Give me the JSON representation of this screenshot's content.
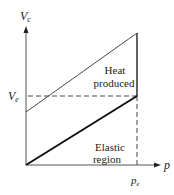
{
  "diagram": {
    "axes": {
      "y_label": "V",
      "y_label_sub": "c",
      "x_label": "p",
      "y_tick_label": "V",
      "y_tick_sub": "e",
      "x_tick_label": "p",
      "x_tick_sub": "e"
    },
    "regions": {
      "upper": {
        "line1": "Heat",
        "line2": "produced"
      },
      "lower": {
        "line1": "Elastic",
        "line2": "region"
      }
    },
    "colors": {
      "axis": "#444444",
      "line": "#222222",
      "dash": "#333333",
      "text": "#222222"
    }
  }
}
